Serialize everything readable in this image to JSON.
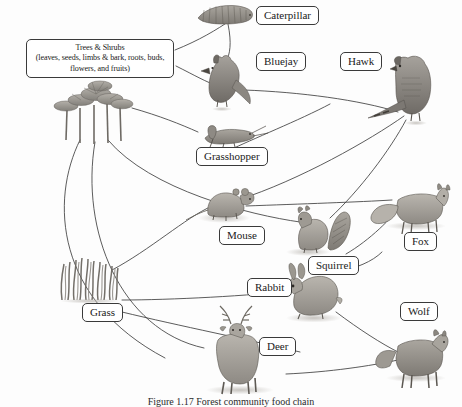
{
  "figure": {
    "caption": "Figure 1.17 Forest community food chain"
  },
  "diagram": {
    "type": "food-web",
    "background_color": "#fdfdfd",
    "line_color": "#3a3a3a",
    "label_border_color": "#3a3a3a",
    "label_fill_color": "#ffffff",
    "nodes": [
      {
        "id": "trees",
        "label": "Trees & Shrubs",
        "sublabel": "(leaves, seeds, limbs & bark, roots, buds, flowers, and fruits)",
        "label_x": 26,
        "label_y": 39,
        "label_w": 148,
        "art_x": 58,
        "art_y": 82,
        "kind": "producer"
      },
      {
        "id": "caterpillar",
        "label": "Caterpillar",
        "label_x": 256,
        "label_y": 6,
        "art_x": 196,
        "art_y": 2,
        "kind": "consumer"
      },
      {
        "id": "bluejay",
        "label": "Bluejay",
        "label_x": 256,
        "label_y": 52,
        "art_x": 196,
        "art_y": 58,
        "kind": "consumer"
      },
      {
        "id": "hawk",
        "label": "Hawk",
        "label_x": 340,
        "label_y": 52,
        "art_x": 378,
        "art_y": 52,
        "kind": "predator"
      },
      {
        "id": "grasshopper",
        "label": "Grasshopper",
        "label_x": 196,
        "label_y": 147,
        "art_x": 198,
        "art_y": 124,
        "kind": "consumer"
      },
      {
        "id": "mouse",
        "label": "Mouse",
        "label_x": 219,
        "label_y": 226,
        "art_x": 200,
        "art_y": 188,
        "kind": "consumer"
      },
      {
        "id": "squirrel",
        "label": "Squirrel",
        "label_x": 308,
        "label_y": 256,
        "art_x": 293,
        "art_y": 212,
        "kind": "consumer"
      },
      {
        "id": "fox",
        "label": "Fox",
        "label_x": 404,
        "label_y": 232,
        "art_x": 380,
        "art_y": 186,
        "kind": "predator"
      },
      {
        "id": "grass",
        "label": "Grass",
        "label_x": 82,
        "label_y": 303,
        "art_x": 82,
        "art_y": 262,
        "kind": "producer"
      },
      {
        "id": "rabbit",
        "label": "Rabbit",
        "label_x": 247,
        "label_y": 278,
        "art_x": 300,
        "art_y": 272,
        "kind": "consumer"
      },
      {
        "id": "deer",
        "label": "Deer",
        "label_x": 259,
        "label_y": 337,
        "art_x": 196,
        "art_y": 322,
        "kind": "consumer"
      },
      {
        "id": "wolf",
        "label": "Wolf",
        "label_x": 400,
        "label_y": 302,
        "art_x": 378,
        "art_y": 330,
        "kind": "predator"
      }
    ],
    "links": [
      {
        "from": "trees",
        "to": "caterpillar"
      },
      {
        "from": "trees",
        "to": "bluejay"
      },
      {
        "from": "trees",
        "to": "grasshopper"
      },
      {
        "from": "trees",
        "to": "squirrel"
      },
      {
        "from": "trees",
        "to": "deer"
      },
      {
        "from": "trees",
        "to": "rabbit"
      },
      {
        "from": "caterpillar",
        "to": "bluejay"
      },
      {
        "from": "bluejay",
        "to": "hawk"
      },
      {
        "from": "grasshopper",
        "to": "bluejay"
      },
      {
        "from": "grass",
        "to": "mouse"
      },
      {
        "from": "grass",
        "to": "rabbit"
      },
      {
        "from": "grass",
        "to": "deer"
      },
      {
        "from": "mouse",
        "to": "hawk"
      },
      {
        "from": "mouse",
        "to": "fox"
      },
      {
        "from": "squirrel",
        "to": "hawk"
      },
      {
        "from": "squirrel",
        "to": "fox"
      },
      {
        "from": "rabbit",
        "to": "fox"
      },
      {
        "from": "rabbit",
        "to": "wolf"
      },
      {
        "from": "deer",
        "to": "wolf"
      }
    ]
  }
}
